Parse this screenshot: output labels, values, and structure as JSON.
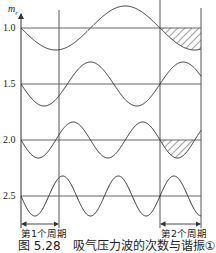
{
  "figure": {
    "axis_title": "m",
    "axis_title_sub": "r",
    "y_labels": [
      "1.0",
      "1.5",
      "2.0",
      "2.5"
    ],
    "period_labels": [
      "第1个周期",
      "第2个周期"
    ],
    "caption": "图 5.28　吸气压力波的次数与谐振①"
  },
  "chart_data": {
    "type": "line",
    "ylabel": "m_r",
    "series": [
      {
        "name": "1.0",
        "cycles_per_period": 1.0,
        "phase": "start downward",
        "hatched_in_period_2": true
      },
      {
        "name": "1.5",
        "cycles_per_period": 1.5,
        "phase": "start downward",
        "hatched_in_period_2": false
      },
      {
        "name": "2.0",
        "cycles_per_period": 2.0,
        "phase": "start downward",
        "hatched_in_period_2": true
      },
      {
        "name": "2.5",
        "cycles_per_period": 2.5,
        "phase": "start downward",
        "hatched_in_period_2": false
      }
    ],
    "annotations": [
      "第1个周期",
      "第2个周期"
    ],
    "grid": false
  },
  "colors": {
    "line": "#333333",
    "grid": "#555555"
  }
}
